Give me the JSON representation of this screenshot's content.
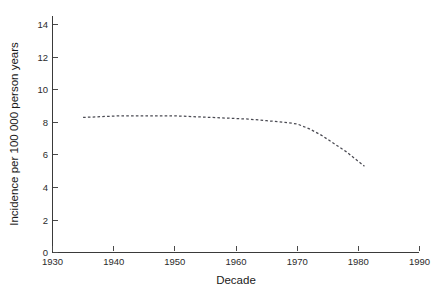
{
  "chart_data": {
    "type": "line",
    "title": "",
    "subtitle": "",
    "xlabel": "Decade",
    "ylabel": "Incidence per 100 000 person years",
    "xlim": [
      1930,
      1990
    ],
    "ylim": [
      0,
      15
    ],
    "xticks": [
      1930,
      1940,
      1950,
      1960,
      1970,
      1980,
      1990
    ],
    "xtick_labels": [
      "1930",
      "1940",
      "1950",
      "1960",
      "1970",
      "1980",
      "1990"
    ],
    "yticks": [
      0,
      2,
      4,
      6,
      8,
      10,
      12,
      14
    ],
    "ytick_labels": [
      "0",
      "2",
      "4",
      "6",
      "8",
      "10",
      "12",
      "14"
    ],
    "grid": false,
    "legend": false,
    "legend_position": "none",
    "line_style": "dashed",
    "line_color": "#4a4a52",
    "axis_color": "#3a3a3a",
    "background_color": "#ffffff",
    "series": [
      {
        "name": "Incidence",
        "x": [
          1935,
          1938,
          1941,
          1944,
          1947,
          1950,
          1953,
          1956,
          1959,
          1962,
          1965,
          1968,
          1970,
          1972,
          1974,
          1976,
          1978,
          1980,
          1981
        ],
        "values": [
          8.3,
          8.35,
          8.4,
          8.4,
          8.4,
          8.4,
          8.35,
          8.3,
          8.25,
          8.2,
          8.1,
          8.0,
          7.9,
          7.6,
          7.2,
          6.7,
          6.2,
          5.6,
          5.3
        ]
      }
    ],
    "annotations": []
  },
  "figure": {
    "name": "incidence-by-decade-chart"
  }
}
